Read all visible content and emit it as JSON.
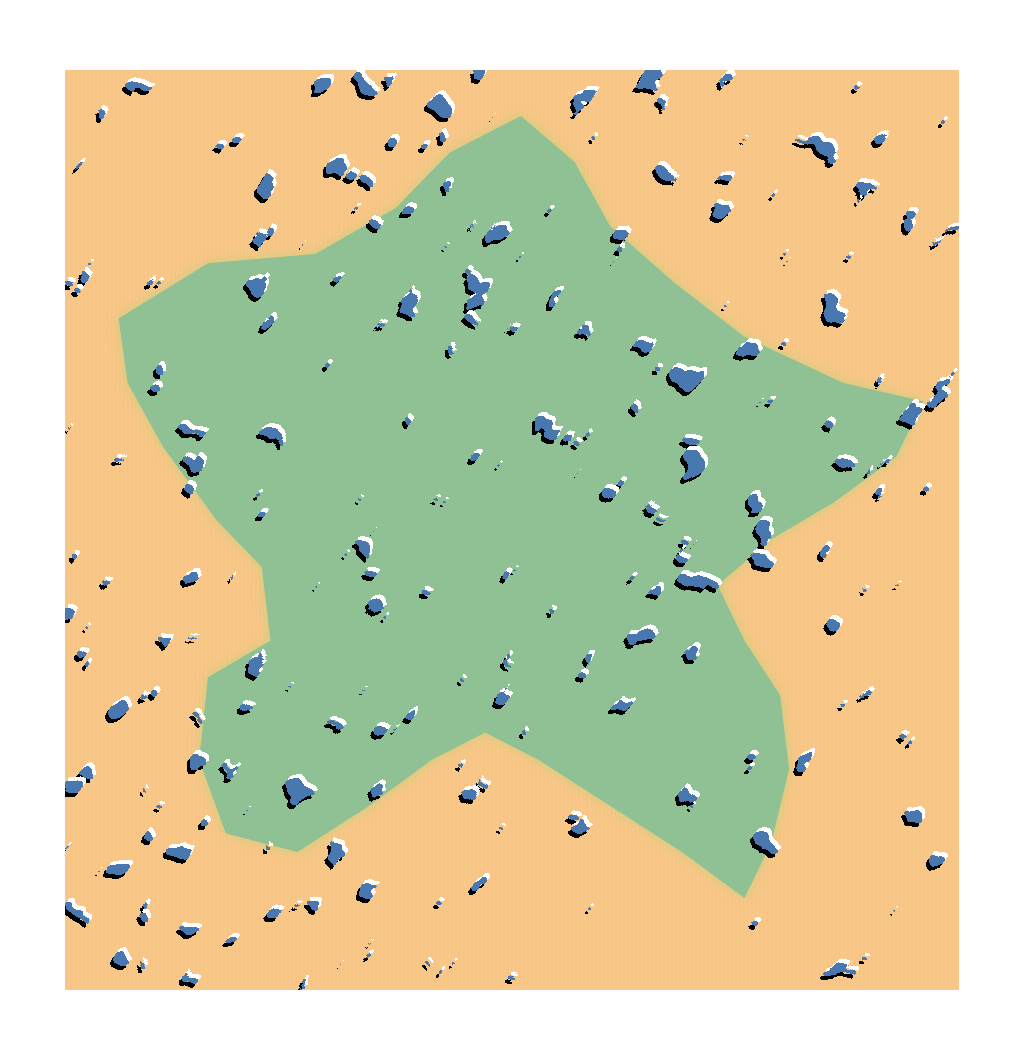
{
  "map": {
    "style": "embossed-turing-pattern",
    "colors": {
      "outside_fill": "#f7c585",
      "region_fill": "#8fc194",
      "region_edge": "#c6cf7e",
      "pattern_fill": "#4a77b0",
      "shadow": "#000000",
      "highlight": "#ffffff",
      "page_background": "#ffffff"
    },
    "region": {
      "name": "highlighted-region",
      "outline": [
        [
          0.06,
          0.27
        ],
        [
          0.16,
          0.21
        ],
        [
          0.28,
          0.2
        ],
        [
          0.37,
          0.15
        ],
        [
          0.43,
          0.09
        ],
        [
          0.51,
          0.05
        ],
        [
          0.57,
          0.1
        ],
        [
          0.61,
          0.17
        ],
        [
          0.68,
          0.23
        ],
        [
          0.76,
          0.29
        ],
        [
          0.87,
          0.34
        ],
        [
          0.96,
          0.36
        ],
        [
          0.93,
          0.42
        ],
        [
          0.86,
          0.47
        ],
        [
          0.79,
          0.51
        ],
        [
          0.73,
          0.56
        ],
        [
          0.76,
          0.62
        ],
        [
          0.8,
          0.68
        ],
        [
          0.81,
          0.76
        ],
        [
          0.79,
          0.84
        ],
        [
          0.76,
          0.9
        ],
        [
          0.69,
          0.85
        ],
        [
          0.61,
          0.8
        ],
        [
          0.53,
          0.75
        ],
        [
          0.47,
          0.72
        ],
        [
          0.41,
          0.75
        ],
        [
          0.34,
          0.8
        ],
        [
          0.26,
          0.85
        ],
        [
          0.18,
          0.83
        ],
        [
          0.15,
          0.75
        ],
        [
          0.16,
          0.66
        ],
        [
          0.23,
          0.62
        ],
        [
          0.22,
          0.54
        ],
        [
          0.17,
          0.49
        ],
        [
          0.11,
          0.41
        ],
        [
          0.07,
          0.34
        ]
      ]
    }
  }
}
